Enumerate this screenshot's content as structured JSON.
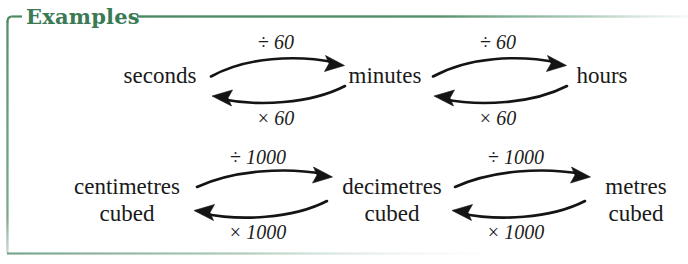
{
  "panel": {
    "title": "Examples",
    "accent_color": "#3a7a55",
    "background_color": "#ffffff",
    "text_color": "#1a1a1a"
  },
  "diagram": {
    "type": "conversion-flow",
    "rows": [
      {
        "id": "time",
        "nodes": [
          {
            "id": "seconds",
            "line1": "seconds",
            "line2": ""
          },
          {
            "id": "minutes",
            "line1": "minutes",
            "line2": ""
          },
          {
            "id": "hours",
            "line1": "hours",
            "line2": ""
          }
        ],
        "pairs": [
          {
            "from": "seconds",
            "to": "minutes",
            "forward_label_symbol": "÷",
            "forward_label_value": "60",
            "backward_label_symbol": "×",
            "backward_label_value": "60"
          },
          {
            "from": "minutes",
            "to": "hours",
            "forward_label_symbol": "÷",
            "forward_label_value": "60",
            "backward_label_symbol": "×",
            "backward_label_value": "60"
          }
        ]
      },
      {
        "id": "volume",
        "nodes": [
          {
            "id": "centimetres-cubed",
            "line1": "centimetres",
            "line2": "cubed"
          },
          {
            "id": "decimetres-cubed",
            "line1": "decimetres",
            "line2": "cubed"
          },
          {
            "id": "metres-cubed",
            "line1": "metres",
            "line2": "cubed"
          }
        ],
        "pairs": [
          {
            "from": "centimetres-cubed",
            "to": "decimetres-cubed",
            "forward_label_symbol": "÷",
            "forward_label_value": "1000",
            "backward_label_symbol": "×",
            "backward_label_value": "1000"
          },
          {
            "from": "decimetres-cubed",
            "to": "metres-cubed",
            "forward_label_symbol": "÷",
            "forward_label_value": "1000",
            "backward_label_symbol": "×",
            "backward_label_value": "1000"
          }
        ]
      }
    ],
    "labels": {
      "r1p1_top_sym": "÷",
      "r1p1_top_val": "60",
      "r1p1_bot_sym": "×",
      "r1p1_bot_val": "60",
      "r1p2_top_sym": "÷",
      "r1p2_top_val": "60",
      "r1p2_bot_sym": "×",
      "r1p2_bot_val": "60",
      "r2p1_top_sym": "÷",
      "r2p1_top_val": "1000",
      "r2p1_bot_sym": "×",
      "r2p1_bot_val": "1000",
      "r2p2_top_sym": "÷",
      "r2p2_top_val": "1000",
      "r2p2_bot_sym": "×",
      "r2p2_bot_val": "1000"
    },
    "nodes_flat": {
      "seconds": "seconds",
      "minutes": "minutes",
      "hours": "hours",
      "centimetres": "centimetres",
      "cubed1": "cubed",
      "decimetres": "decimetres",
      "cubed2": "cubed",
      "metres": "metres",
      "cubed3": "cubed"
    }
  }
}
